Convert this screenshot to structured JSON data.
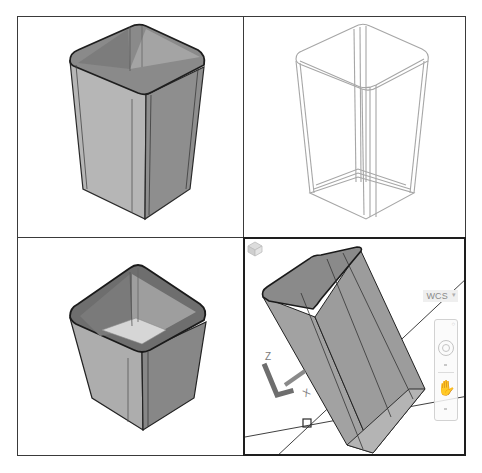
{
  "viewports": [
    {
      "id": "top-left",
      "style": "realistic",
      "view": "se-isometric",
      "object": "tapered-bin-shell",
      "active": false
    },
    {
      "id": "top-right",
      "style": "wireframe",
      "view": "se-isometric",
      "object": "tapered-bin-shell",
      "active": false
    },
    {
      "id": "bottom-left",
      "style": "realistic",
      "view": "top-isometric",
      "object": "tapered-bin-shell",
      "active": false
    },
    {
      "id": "bottom-right",
      "style": "shaded",
      "view": "custom-3d",
      "object": "tapered-bin-shell",
      "active": true
    }
  ],
  "active_viewport": {
    "wcs_label": "WCS",
    "ucs_icon": {
      "z_label": "Z",
      "x_label": "X"
    },
    "navbar": {
      "orbit_icon": "steering-wheel-icon",
      "pan_icon": "hand-pan-icon"
    },
    "viewcube_icon": "viewcube-icon"
  },
  "colors": {
    "frame": "#3a3a3a",
    "active_frame": "#1e1e1e",
    "shade_light": "#b8b8b8",
    "shade_mid": "#9c9c9c",
    "shade_dark": "#7a7a7a",
    "wire": "#a6a6a6"
  }
}
